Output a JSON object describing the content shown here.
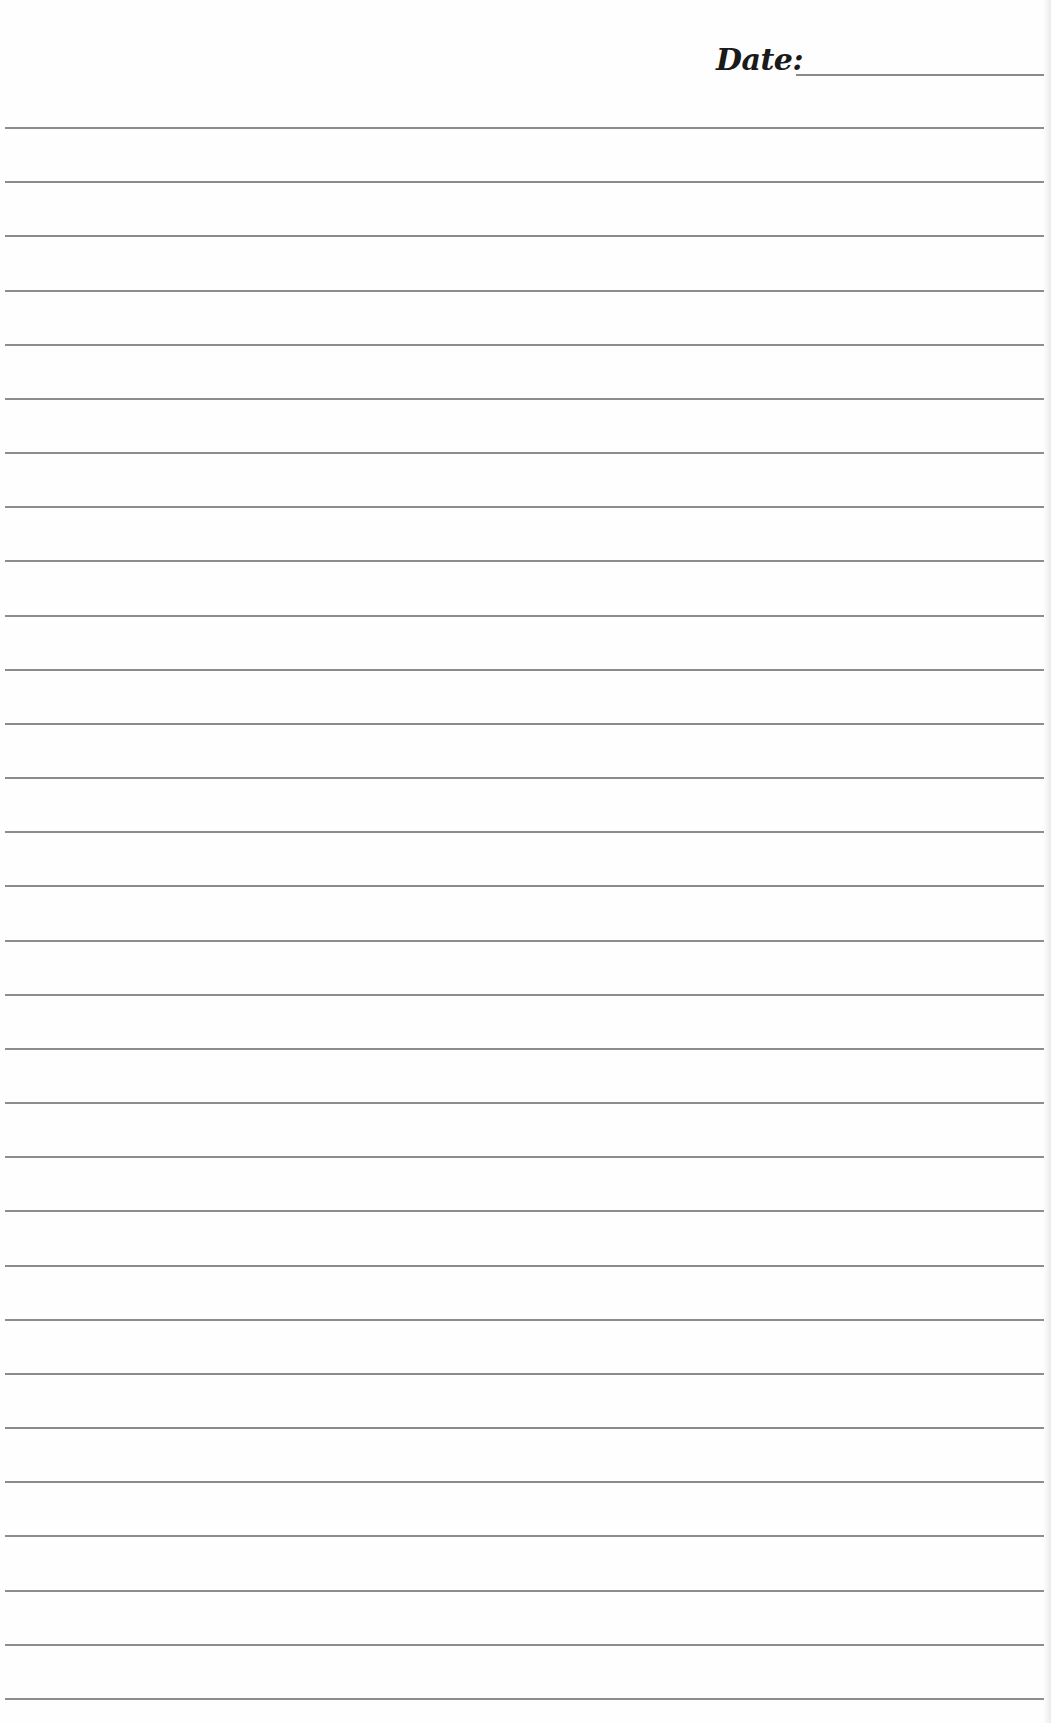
{
  "header": {
    "date_label": "Date:",
    "date_value": ""
  },
  "ruled_lines": {
    "count": 30,
    "first_top_px": 127,
    "spacing_px": 54.17,
    "left_px": 5,
    "width_px": 1039,
    "color": "#8c8c8c"
  },
  "colors": {
    "paper": "#fefefe",
    "text": "#1a1a1a",
    "line": "#8c8c8c"
  }
}
